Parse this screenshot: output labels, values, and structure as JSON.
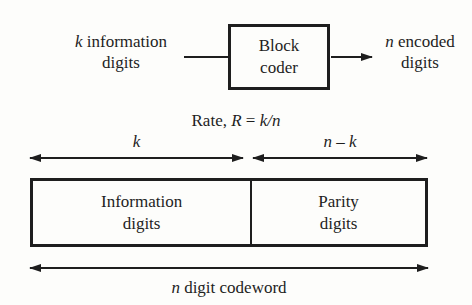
{
  "colors": {
    "ink": "#1e1e1e",
    "background": "#fdfdfb"
  },
  "encoder": {
    "input_label": {
      "var": "k",
      "rest": " information",
      "line2": "digits"
    },
    "box": {
      "line1": "Block",
      "line2": "coder"
    },
    "output_label": {
      "var": "n",
      "rest": " encoded",
      "line2": "digits"
    }
  },
  "rate": {
    "prefix": "Rate, ",
    "var": "R",
    "equals": " = ",
    "value": "k/n"
  },
  "extents": {
    "k_label": "k",
    "nk_label": "n – k"
  },
  "codeword": {
    "left_cell": {
      "line1": "Information",
      "line2": "digits"
    },
    "right_cell": {
      "line1": "Parity",
      "line2": "digits"
    },
    "bottom_label": {
      "var": "n",
      "rest": " digit codeword"
    }
  }
}
